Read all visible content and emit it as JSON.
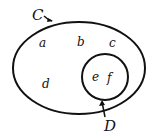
{
  "diagram": {
    "type": "venn",
    "sets": [
      {
        "name": "C",
        "elements": [
          "a",
          "b",
          "c",
          "d",
          "e",
          "f"
        ]
      },
      {
        "name": "D",
        "elements": [
          "e",
          "f"
        ]
      }
    ],
    "labels": {
      "outer": "C",
      "inner": "D"
    },
    "elements": {
      "a": "a",
      "b": "b",
      "c": "c",
      "d": "d",
      "e": "e",
      "f": "f"
    }
  }
}
